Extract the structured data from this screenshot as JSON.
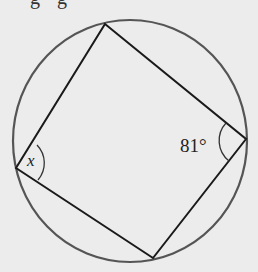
{
  "header": {
    "cropped_text": "g g"
  },
  "diagram": {
    "type": "cyclic-quadrilateral",
    "circle": {
      "cx": 130,
      "cy": 141,
      "rx": 117,
      "ry": 121,
      "stroke": "#555555"
    },
    "vertices": {
      "top": [
        105,
        24
      ],
      "right": [
        246,
        139
      ],
      "bottom": [
        153,
        258
      ],
      "left": [
        16,
        168
      ]
    },
    "edge_color": "#1a1a1a",
    "angles": [
      {
        "vertex": "right",
        "label": "81°"
      },
      {
        "vertex": "left",
        "label": "x"
      }
    ]
  }
}
